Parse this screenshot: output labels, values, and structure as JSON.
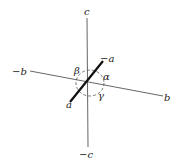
{
  "diagram": {
    "axes": [
      {
        "name": "c-axis",
        "positive_label": "c",
        "negative_label": "−c"
      },
      {
        "name": "b-axis",
        "positive_label": "b",
        "negative_label": "−b"
      },
      {
        "name": "a-axis",
        "positive_label": "a",
        "negative_label": "−a"
      }
    ],
    "angles": [
      {
        "name": "alpha",
        "label": "α",
        "between": "b and c"
      },
      {
        "name": "beta",
        "label": "β",
        "between": "a and c"
      },
      {
        "name": "gamma",
        "label": "γ",
        "between": "a and b"
      }
    ],
    "colors": {
      "line": "#333333",
      "background": "#ffffff"
    }
  }
}
